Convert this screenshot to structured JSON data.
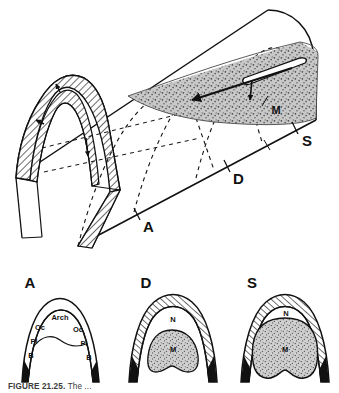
{
  "figure": {
    "domain_kind": "scientific-illustration",
    "caption_number": "FIGURE 21.25.",
    "caption_body": "The ...",
    "colors": {
      "ink": "#111111",
      "paper": "#ffffff",
      "stipple_fill": "#c9c9c9",
      "stipple_dot": "#4a4a4a",
      "hatch_line": "#111111",
      "caption_gray": "#3b3b3b"
    }
  },
  "top_panel": {
    "name": "three-dimensional-arch-tube",
    "description": "Half-cylinder vault cut open at the left end showing a hatched arch wall, with three dashed transverse arch ribs and a stippled wedge of mesoderm on the right flank.",
    "section_markers": [
      {
        "id": "A",
        "label": "A"
      },
      {
        "id": "D",
        "label": "D"
      },
      {
        "id": "S",
        "label": "S"
      }
    ],
    "inner_labels": [
      {
        "id": "M",
        "label": "M"
      }
    ],
    "rib_count": 3,
    "arrow_count_left": 3,
    "arrow_count_right": 2
  },
  "cross_sections": [
    {
      "id": "A",
      "title": "A",
      "regions": [
        {
          "id": "arch",
          "label": "Arch",
          "fill": "none"
        },
        {
          "id": "oc-left",
          "label": "Oc",
          "fill": "none"
        },
        {
          "id": "oc-right",
          "label": "Oc",
          "fill": "none"
        },
        {
          "id": "pl-left",
          "label": "Pl",
          "fill": "none"
        },
        {
          "id": "pl-right",
          "label": "Pl",
          "fill": "none"
        },
        {
          "id": "b-left",
          "label": "B",
          "fill": "none"
        },
        {
          "id": "b-right",
          "label": "B",
          "fill": "none"
        }
      ]
    },
    {
      "id": "D",
      "title": "D",
      "regions": [
        {
          "id": "n",
          "label": "N",
          "fill": "hatched"
        },
        {
          "id": "m",
          "label": "M",
          "fill": "stippled"
        }
      ]
    },
    {
      "id": "S",
      "title": "S",
      "regions": [
        {
          "id": "n",
          "label": "N",
          "fill": "hatched"
        },
        {
          "id": "m",
          "label": "M",
          "fill": "stippled"
        }
      ]
    }
  ]
}
